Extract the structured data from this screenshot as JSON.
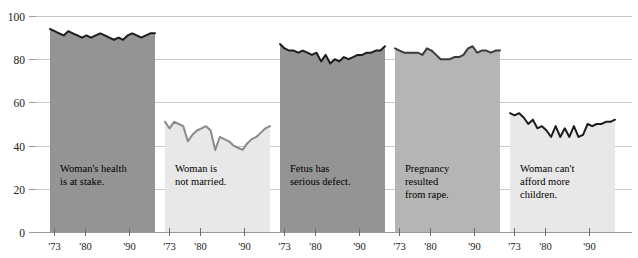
{
  "chart_data": {
    "type": "area",
    "title": "",
    "subtitle": "",
    "xlabel": "",
    "ylabel": "",
    "ylim": [
      0,
      100
    ],
    "xlim": [
      1972,
      1996
    ],
    "grid": true,
    "legend": "none",
    "yticks": [
      0,
      20,
      40,
      60,
      80,
      100
    ],
    "xticks": [
      1973,
      1980,
      1990
    ],
    "xtick_labels": [
      "'73",
      "'80",
      "'90"
    ],
    "panels": [
      {
        "id": "womans-health",
        "label": "Woman's health\nis at stake.",
        "label_lines": [
          "Woman's health",
          "is at stake."
        ],
        "fill": "#949494",
        "line": "#1c1c1c",
        "x": [
          1972,
          1973,
          1974,
          1975,
          1976,
          1977,
          1978,
          1979,
          1980,
          1981,
          1982,
          1983,
          1984,
          1985,
          1986,
          1987,
          1988,
          1989,
          1990,
          1991,
          1992,
          1993,
          1994,
          1995
        ],
        "values": [
          94,
          93,
          92,
          91,
          93,
          92,
          91,
          90,
          91,
          90,
          91,
          92,
          91,
          90,
          89,
          90,
          89,
          91,
          92,
          91,
          90,
          91,
          92,
          92
        ]
      },
      {
        "id": "not-married",
        "label": "Woman is\nnot married.",
        "label_lines": [
          "Woman is",
          "not married."
        ],
        "fill": "#e8e8e8",
        "line": "#8a8a8a",
        "x": [
          1972,
          1973,
          1974,
          1975,
          1976,
          1977,
          1978,
          1979,
          1980,
          1981,
          1982,
          1983,
          1984,
          1985,
          1986,
          1987,
          1988,
          1989,
          1990,
          1991,
          1992,
          1993,
          1994,
          1995
        ],
        "values": [
          51,
          48,
          51,
          50,
          49,
          42,
          45,
          47,
          48,
          49,
          47,
          38,
          44,
          43,
          42,
          40,
          39,
          38,
          41,
          43,
          44,
          46,
          48,
          49
        ]
      },
      {
        "id": "serious-defect",
        "label": "Fetus has\nserious defect.",
        "label_lines": [
          "Fetus has",
          "serious defect."
        ],
        "fill": "#949494",
        "line": "#1c1c1c",
        "x": [
          1972,
          1973,
          1974,
          1975,
          1976,
          1977,
          1978,
          1979,
          1980,
          1981,
          1982,
          1983,
          1984,
          1985,
          1986,
          1987,
          1988,
          1989,
          1990,
          1991,
          1992,
          1993,
          1994,
          1995
        ],
        "values": [
          87,
          85,
          84,
          84,
          83,
          84,
          83,
          82,
          83,
          79,
          82,
          78,
          80,
          79,
          81,
          80,
          81,
          82,
          82,
          83,
          83,
          84,
          84,
          86
        ]
      },
      {
        "id": "rape",
        "label": "Pregnancy\nresulted\nfrom rape.",
        "label_lines": [
          "Pregnancy",
          "resulted",
          "from rape."
        ],
        "fill": "#b5b5b5",
        "line": "#3a3a3a",
        "x": [
          1972,
          1973,
          1974,
          1975,
          1976,
          1977,
          1978,
          1979,
          1980,
          1981,
          1982,
          1983,
          1984,
          1985,
          1986,
          1987,
          1988,
          1989,
          1990,
          1991,
          1992,
          1993,
          1994,
          1995
        ],
        "values": [
          85,
          84,
          83,
          83,
          83,
          83,
          82,
          85,
          84,
          82,
          80,
          80,
          80,
          81,
          81,
          82,
          85,
          86,
          83,
          84,
          84,
          83,
          84,
          84
        ]
      },
      {
        "id": "cant-afford",
        "label": "Woman can't\nafford more\nchildren.",
        "label_lines": [
          "Woman can't",
          "afford more",
          "children."
        ],
        "fill": "#e8e8e8",
        "line": "#1c1c1c",
        "x": [
          1972,
          1973,
          1974,
          1975,
          1976,
          1977,
          1978,
          1979,
          1980,
          1981,
          1982,
          1983,
          1984,
          1985,
          1986,
          1987,
          1988,
          1989,
          1990,
          1991,
          1992,
          1993,
          1994,
          1995
        ],
        "values": [
          55,
          54,
          55,
          53,
          50,
          52,
          48,
          49,
          47,
          44,
          49,
          44,
          48,
          44,
          49,
          44,
          45,
          50,
          49,
          50,
          50,
          51,
          51,
          52
        ]
      }
    ]
  }
}
